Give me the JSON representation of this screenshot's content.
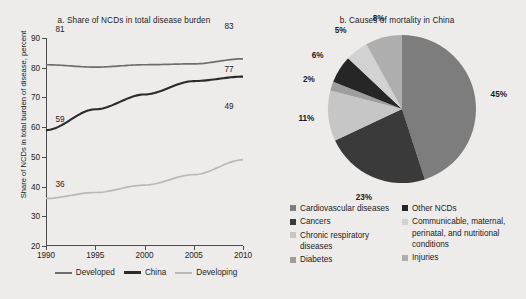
{
  "figure": {
    "background": "#edecea"
  },
  "panel_a": {
    "title": "a. Share of NCDs in total disease burden",
    "ylabel": "Share of NCDs in total burden of disease, percent",
    "yticks": [
      "20",
      "30",
      "40",
      "50",
      "60",
      "70",
      "80",
      "90"
    ],
    "xticks": [
      "1990",
      "1995",
      "2000",
      "2005",
      "2010"
    ],
    "legend": [
      {
        "label": "Developed",
        "color": "#6e6e6e"
      },
      {
        "label": "China",
        "color": "#2b2b2b"
      },
      {
        "label": "Developing",
        "color": "#b9b9b9"
      }
    ],
    "endpoint_labels": {
      "developed_start": "81",
      "developed_end": "83",
      "china_start": "59",
      "china_end": "77",
      "developing_start": "36",
      "developing_end": "49"
    }
  },
  "panel_b": {
    "title": "b. Causes of mortality in China",
    "legend_left": [
      {
        "label": "Cardiovascular diseases",
        "color": "#7d7d7d"
      },
      {
        "label": "Cancers",
        "color": "#3a3a3a"
      },
      {
        "label": "Chronic respiratory diseases",
        "color": "#c6c6c6"
      },
      {
        "label": "Diabetes",
        "color": "#9e9e9e"
      }
    ],
    "legend_right": [
      {
        "label": "Other NCDs",
        "color": "#262626"
      },
      {
        "label": "Communicable, maternal, perinatal, and nutritional conditions",
        "color": "#d2d2d2"
      },
      {
        "label": "Injuries",
        "color": "#aeaeae"
      }
    ]
  },
  "chart_data": [
    {
      "type": "line",
      "title": "a. Share of NCDs in total disease burden",
      "xlabel": "",
      "ylabel": "Share of NCDs in total burden of disease, percent",
      "xlim": [
        1990,
        2010
      ],
      "ylim": [
        20,
        90
      ],
      "ytick_values": [
        20,
        30,
        40,
        50,
        60,
        70,
        80,
        90
      ],
      "xtick_values": [
        1990,
        1995,
        2000,
        2005,
        2010
      ],
      "grid": false,
      "legend_position": "bottom",
      "x": [
        1990,
        1995,
        2000,
        2005,
        2010
      ],
      "series": [
        {
          "name": "Developed",
          "color": "#6e6e6e",
          "values": [
            81,
            80.2,
            81,
            81.3,
            83
          ],
          "start_label": "81",
          "end_label": "83"
        },
        {
          "name": "China",
          "color": "#2b2b2b",
          "values": [
            59,
            66,
            71,
            75.5,
            77
          ],
          "start_label": "59",
          "end_label": "77"
        },
        {
          "name": "Developing",
          "color": "#b9b9b9",
          "values": [
            36,
            38,
            40.5,
            44,
            49
          ],
          "start_label": "36",
          "end_label": "49"
        }
      ]
    },
    {
      "type": "pie",
      "title": "b. Causes of mortality in China",
      "legend_position": "bottom",
      "labels": [
        "Cardiovascular diseases",
        "Cancers",
        "Chronic respiratory diseases",
        "Diabetes",
        "Other NCDs",
        "Communicable, maternal, perinatal, and nutritional conditions",
        "Injuries"
      ],
      "values": [
        45,
        23,
        11,
        2,
        6,
        5,
        8
      ],
      "value_labels": [
        "45%",
        "23%",
        "11%",
        "2%",
        "6%",
        "5%",
        "8%"
      ],
      "colors": [
        "#7d7d7d",
        "#3a3a3a",
        "#c6c6c6",
        "#9e9e9e",
        "#262626",
        "#d2d2d2",
        "#aeaeae"
      ]
    }
  ]
}
